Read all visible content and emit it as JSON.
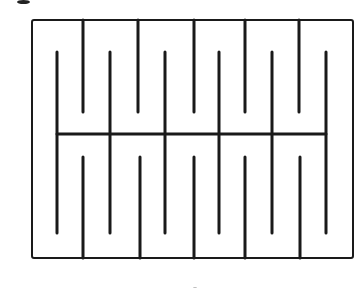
{
  "figure": {
    "colors": {
      "background": "#ffffff",
      "stroke": "#1a1a1a"
    },
    "frame": {
      "x1": 32,
      "y1": 20,
      "x2": 353,
      "y2": 258,
      "stroke_width": 2
    },
    "center_bar": {
      "x1": 57,
      "x2": 326,
      "y": 134,
      "stroke_width": 3
    },
    "top_fingers": {
      "stroke_width": 3,
      "y_start": 20,
      "y_end": 112,
      "x": [
        83,
        138,
        194,
        245,
        299
      ]
    },
    "bottom_fingers": {
      "stroke_width": 3,
      "y_start": 157,
      "y_end": 258,
      "x": [
        83,
        140,
        194,
        245,
        300
      ]
    },
    "long_fingers": {
      "stroke_width": 3,
      "y_start": 52,
      "y_end": 233,
      "x": [
        57,
        110,
        165,
        219,
        272,
        326
      ]
    },
    "marks": [
      {
        "name": "cut-off-glyph",
        "x": 17,
        "y": 0,
        "w": 13,
        "h": 4
      },
      {
        "name": "tick-mark",
        "x": 193,
        "y": 287,
        "w": 4,
        "h": 1
      }
    ]
  }
}
